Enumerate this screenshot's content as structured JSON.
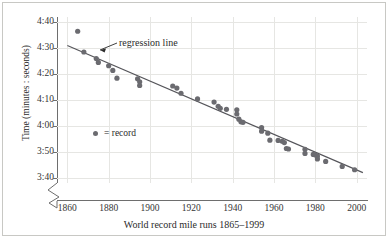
{
  "figure": {
    "caption_title": "World record mile runs 1865–1999"
  },
  "annotations": {
    "regression_label": "regression line",
    "legend_label": "= record"
  },
  "chart_data": {
    "type": "scatter",
    "title": "World record mile runs 1865–1999",
    "xlabel": "World record mile runs 1865–1999",
    "ylabel": "Time (minutes : seconds)",
    "xlim": [
      1855,
      2005
    ],
    "ylim_seconds": [
      218,
      282
    ],
    "xticks": [
      1860,
      1880,
      1900,
      1920,
      1940,
      1960,
      1980,
      2000
    ],
    "xtick_labels": [
      "1860",
      "1880",
      "1900",
      "1920",
      "1940",
      "1960",
      "1980",
      "2000"
    ],
    "yticks_seconds": [
      280,
      270,
      260,
      250,
      240,
      230,
      220
    ],
    "ytick_labels": [
      "4:40",
      "4:30",
      "4:20",
      "4:10",
      "4:00",
      "3:50",
      "3:40"
    ],
    "grid": true,
    "y_axis_break": true,
    "legend": "= record",
    "marker_color": "#6b6b70",
    "line_color": "#55555a",
    "grid_color": "#e6e6e3",
    "axis_color": "#6e6e6e",
    "series": [
      {
        "name": "record",
        "type": "scatter",
        "points": [
          {
            "x": 1865,
            "y_seconds": 276.5,
            "y_label": "4:36.5"
          },
          {
            "x": 1868,
            "y_seconds": 268.5,
            "y_label": "4:28.5"
          },
          {
            "x": 1874,
            "y_seconds": 266.0,
            "y_label": "4:26.0"
          },
          {
            "x": 1875,
            "y_seconds": 264.5,
            "y_label": "4:24.5"
          },
          {
            "x": 1880,
            "y_seconds": 263.2,
            "y_label": "4:23.2"
          },
          {
            "x": 1882,
            "y_seconds": 261.4,
            "y_label": "4:21.4"
          },
          {
            "x": 1884,
            "y_seconds": 258.4,
            "y_label": "4:18.4"
          },
          {
            "x": 1894,
            "y_seconds": 258.2,
            "y_label": "4:18.2"
          },
          {
            "x": 1895,
            "y_seconds": 257.0,
            "y_label": "4:17.0"
          },
          {
            "x": 1895,
            "y_seconds": 255.6,
            "y_label": "4:15.6"
          },
          {
            "x": 1911,
            "y_seconds": 255.4,
            "y_label": "4:15.4"
          },
          {
            "x": 1913,
            "y_seconds": 254.6,
            "y_label": "4:14.6"
          },
          {
            "x": 1915,
            "y_seconds": 252.6,
            "y_label": "4:12.6"
          },
          {
            "x": 1923,
            "y_seconds": 250.4,
            "y_label": "4:10.4"
          },
          {
            "x": 1931,
            "y_seconds": 249.2,
            "y_label": "4:09.2"
          },
          {
            "x": 1933,
            "y_seconds": 247.6,
            "y_label": "4:07.6"
          },
          {
            "x": 1934,
            "y_seconds": 246.8,
            "y_label": "4:06.8"
          },
          {
            "x": 1937,
            "y_seconds": 246.4,
            "y_label": "4:06.4"
          },
          {
            "x": 1942,
            "y_seconds": 246.2,
            "y_label": "4:06.2"
          },
          {
            "x": 1942,
            "y_seconds": 244.6,
            "y_label": "4:04.6"
          },
          {
            "x": 1943,
            "y_seconds": 242.6,
            "y_label": "4:02.6"
          },
          {
            "x": 1944,
            "y_seconds": 241.6,
            "y_label": "4:01.6"
          },
          {
            "x": 1945,
            "y_seconds": 241.4,
            "y_label": "4:01.4"
          },
          {
            "x": 1954,
            "y_seconds": 239.4,
            "y_label": "3:59.4"
          },
          {
            "x": 1954,
            "y_seconds": 238.0,
            "y_label": "3:58.0"
          },
          {
            "x": 1957,
            "y_seconds": 237.2,
            "y_label": "3:57.2"
          },
          {
            "x": 1958,
            "y_seconds": 234.5,
            "y_label": "3:54.5"
          },
          {
            "x": 1962,
            "y_seconds": 234.4,
            "y_label": "3:54.4"
          },
          {
            "x": 1964,
            "y_seconds": 234.1,
            "y_label": "3:54.1"
          },
          {
            "x": 1965,
            "y_seconds": 233.6,
            "y_label": "3:53.6"
          },
          {
            "x": 1966,
            "y_seconds": 231.3,
            "y_label": "3:51.3"
          },
          {
            "x": 1967,
            "y_seconds": 231.1,
            "y_label": "3:51.1"
          },
          {
            "x": 1975,
            "y_seconds": 231.0,
            "y_label": "3:51.0"
          },
          {
            "x": 1975,
            "y_seconds": 229.4,
            "y_label": "3:49.4"
          },
          {
            "x": 1979,
            "y_seconds": 229.0,
            "y_label": "3:49.0"
          },
          {
            "x": 1980,
            "y_seconds": 228.8,
            "y_label": "3:48.8"
          },
          {
            "x": 1981,
            "y_seconds": 228.4,
            "y_label": "3:48.4"
          },
          {
            "x": 1981,
            "y_seconds": 227.3,
            "y_label": "3:47.3"
          },
          {
            "x": 1985,
            "y_seconds": 226.3,
            "y_label": "3:46.3"
          },
          {
            "x": 1993,
            "y_seconds": 224.4,
            "y_label": "3:44.4"
          },
          {
            "x": 1999,
            "y_seconds": 223.1,
            "y_label": "3:43.1"
          }
        ]
      },
      {
        "name": "regression line",
        "type": "line",
        "endpoints": [
          {
            "x": 1860,
            "y_seconds": 271.0
          },
          {
            "x": 2003,
            "y_seconds": 222.0
          }
        ]
      }
    ]
  }
}
